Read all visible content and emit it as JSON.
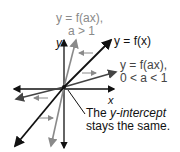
{
  "labels": {
    "stretch_top_line1": "y = f(ax),",
    "stretch_top_line2": "a > 1",
    "parent": "y = f(x)",
    "shrink_line1": "y = f(ax),",
    "shrink_line2": "0 < a < 1",
    "x_axis": "x",
    "y_axis": "y",
    "note_line1_prefix": "The ",
    "note_line1_italic": "y-intercept",
    "note_line2": "stays the same."
  },
  "colors": {
    "parent": "#111111",
    "steep": "#8a8a8a",
    "shallow": "#444444",
    "axis": "#111111",
    "arrow_hint": "#8a8a8a"
  }
}
